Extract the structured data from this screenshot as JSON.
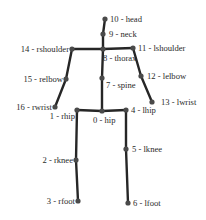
{
  "diagram": {
    "type": "skeleton-keypoints",
    "colors": {
      "bone": "#262626",
      "joint": "#4a4a4a",
      "label": "#2a2a2a",
      "background": "#ffffff"
    },
    "joints": [
      {
        "id": 0,
        "name": "hip",
        "label": "0 - hip",
        "x": 102,
        "y": 111,
        "lx": 93,
        "ly": 123,
        "anchor": "start"
      },
      {
        "id": 1,
        "name": "rhip",
        "label": "1 - rhip",
        "x": 77,
        "y": 110,
        "lx": 75,
        "ly": 119,
        "anchor": "end"
      },
      {
        "id": 2,
        "name": "rknee",
        "label": "2 - rknee",
        "x": 76,
        "y": 160,
        "lx": 73,
        "ly": 163,
        "anchor": "end"
      },
      {
        "id": 3,
        "name": "rfoot",
        "label": "3 - rfoot",
        "x": 78,
        "y": 201,
        "lx": 75,
        "ly": 204,
        "anchor": "end"
      },
      {
        "id": 4,
        "name": "lhip",
        "label": "4 - lhip",
        "x": 126,
        "y": 110,
        "lx": 131,
        "ly": 113,
        "anchor": "start"
      },
      {
        "id": 5,
        "name": "lknee",
        "label": "5 - lknee",
        "x": 126,
        "y": 149,
        "lx": 132,
        "ly": 152,
        "anchor": "start"
      },
      {
        "id": 6,
        "name": "lfoot",
        "label": "6 - lfoot",
        "x": 128,
        "y": 203,
        "lx": 133,
        "ly": 206,
        "anchor": "start"
      },
      {
        "id": 7,
        "name": "spine",
        "label": "7 - spine",
        "x": 102,
        "y": 78,
        "lx": 106,
        "ly": 88,
        "anchor": "start"
      },
      {
        "id": 8,
        "name": "thorax",
        "label": "8 - thorax",
        "x": 103,
        "y": 49,
        "lx": 103,
        "ly": 61,
        "anchor": "start"
      },
      {
        "id": 9,
        "name": "neck",
        "label": "9 - neck",
        "x": 103,
        "y": 34,
        "lx": 109,
        "ly": 37,
        "anchor": "start"
      },
      {
        "id": 10,
        "name": "head",
        "label": "10 - head",
        "x": 105,
        "y": 19,
        "lx": 110,
        "ly": 22,
        "anchor": "start"
      },
      {
        "id": 11,
        "name": "lshoulder",
        "label": "11 - lshoulder",
        "x": 133,
        "y": 48,
        "lx": 138,
        "ly": 51,
        "anchor": "start"
      },
      {
        "id": 12,
        "name": "lelbow",
        "label": "12 - lelbow",
        "x": 141,
        "y": 76,
        "lx": 147,
        "ly": 79,
        "anchor": "start"
      },
      {
        "id": 13,
        "name": "lwrist",
        "label": "13 - lwrist",
        "x": 152,
        "y": 102,
        "lx": 161,
        "ly": 105,
        "anchor": "start"
      },
      {
        "id": 14,
        "name": "rshoulder",
        "label": "14 - rshoulder",
        "x": 72,
        "y": 49,
        "lx": 69,
        "ly": 52,
        "anchor": "end"
      },
      {
        "id": 15,
        "name": "relbow",
        "label": "15 - relbow",
        "x": 66,
        "y": 79,
        "lx": 63,
        "ly": 82,
        "anchor": "end"
      },
      {
        "id": 16,
        "name": "rwrist",
        "label": "16 - rwrist",
        "x": 55,
        "y": 107,
        "lx": 52,
        "ly": 110,
        "anchor": "end"
      }
    ],
    "bones": [
      [
        10,
        9
      ],
      [
        9,
        8
      ],
      [
        8,
        7
      ],
      [
        7,
        0
      ],
      [
        14,
        8
      ],
      [
        8,
        11
      ],
      [
        14,
        15
      ],
      [
        15,
        16
      ],
      [
        11,
        12
      ],
      [
        12,
        13
      ],
      [
        1,
        0
      ],
      [
        0,
        4
      ],
      [
        1,
        2
      ],
      [
        2,
        3
      ],
      [
        4,
        5
      ],
      [
        5,
        6
      ]
    ]
  }
}
